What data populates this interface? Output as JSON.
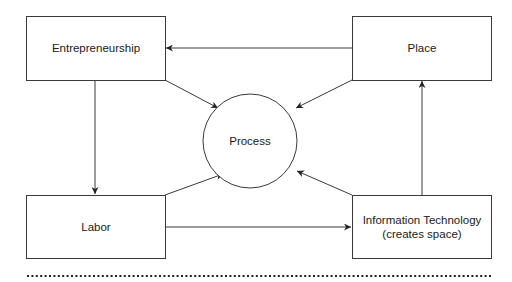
{
  "diagram": {
    "nodes": [
      {
        "id": "entrepreneurship",
        "shape": "rect",
        "lines": [
          "Entrepreneurship"
        ]
      },
      {
        "id": "place",
        "shape": "rect",
        "lines": [
          "Place"
        ]
      },
      {
        "id": "process",
        "shape": "circle",
        "lines": [
          "Process"
        ]
      },
      {
        "id": "labor",
        "shape": "rect",
        "lines": [
          "Labor"
        ]
      },
      {
        "id": "infotech",
        "shape": "rect",
        "lines": [
          "Information Technology",
          "(creates space)"
        ]
      }
    ],
    "edges": [
      {
        "from": "place",
        "to": "entrepreneurship"
      },
      {
        "from": "entrepreneurship",
        "to": "process"
      },
      {
        "from": "place",
        "to": "process"
      },
      {
        "from": "entrepreneurship",
        "to": "labor"
      },
      {
        "from": "labor",
        "to": "process"
      },
      {
        "from": "infotech",
        "to": "process"
      },
      {
        "from": "labor",
        "to": "infotech"
      },
      {
        "from": "infotech",
        "to": "place"
      }
    ],
    "colors": {
      "stroke": "#3a3a3a",
      "text": "#1a1a1a",
      "background": "#ffffff"
    }
  }
}
